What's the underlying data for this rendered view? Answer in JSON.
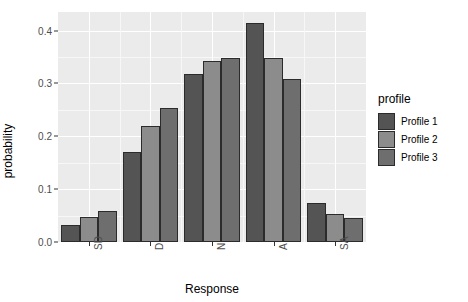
{
  "chart_data": {
    "type": "bar",
    "title": "",
    "subtitle": "",
    "xlabel": "Response",
    "ylabel": "probability",
    "categories": [
      "SD",
      "D",
      "N",
      "A",
      "SA"
    ],
    "series": [
      {
        "name": "Profile 1",
        "color": "#545454",
        "values": [
          0.033,
          0.171,
          0.317,
          0.415,
          0.073
        ]
      },
      {
        "name": "Profile 2",
        "color": "#8c8c8c",
        "values": [
          0.047,
          0.22,
          0.342,
          0.348,
          0.053
        ]
      },
      {
        "name": "Profile 3",
        "color": "#6e6e6e",
        "values": [
          0.058,
          0.254,
          0.348,
          0.308,
          0.046
        ]
      }
    ],
    "ylim": [
      0.0,
      0.435
    ],
    "yticks": [
      0.0,
      0.1,
      0.2,
      0.3,
      0.4
    ],
    "ytick_labels": [
      "0.0",
      "0.1",
      "0.2",
      "0.3",
      "0.4"
    ],
    "grid": true,
    "grid_major_color": "#ffffff",
    "grid_minor_color": "#f7f7f7",
    "panel_background": "#ebebeb",
    "plot_background": "#ffffff",
    "bar_outline_color": "#2b2b2b",
    "legend_position": "right",
    "legend_title": "profile",
    "xtick_label_rotation": 90
  },
  "legend": {
    "title": "profile",
    "entries": [
      {
        "label": "Profile 1",
        "color": "#545454"
      },
      {
        "label": "Profile 2",
        "color": "#8c8c8c"
      },
      {
        "label": "Profile 3",
        "color": "#6e6e6e"
      }
    ]
  }
}
